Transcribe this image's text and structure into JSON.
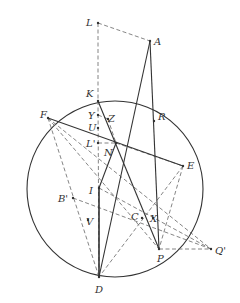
{
  "figure": {
    "type": "geometry-diagram",
    "circle": {
      "cx": 115,
      "cy": 189,
      "r": 88
    },
    "points": [
      {
        "id": "L",
        "label": "L",
        "x": 98,
        "y": 23,
        "lx": 86,
        "ly": 26
      },
      {
        "id": "A",
        "label": "A",
        "x": 150,
        "y": 41,
        "lx": 154,
        "ly": 45
      },
      {
        "id": "K",
        "label": "K",
        "x": 98,
        "y": 101,
        "lx": 86,
        "ly": 97
      },
      {
        "id": "R",
        "label": "R",
        "x": 154,
        "y": 121,
        "lx": 158,
        "ly": 120
      },
      {
        "id": "F",
        "label": "F",
        "x": 48,
        "y": 118,
        "lx": 40,
        "ly": 118
      },
      {
        "id": "Y",
        "label": "Y",
        "x": 98,
        "y": 115,
        "lx": 88,
        "ly": 119
      },
      {
        "id": "Z",
        "label": "Z",
        "x": 108,
        "y": 119,
        "lx": 108,
        "ly": 122
      },
      {
        "id": "U",
        "label": "U",
        "x": 98,
        "y": 128,
        "lx": 88,
        "ly": 131
      },
      {
        "id": "L'",
        "label": "L'",
        "x": 98,
        "y": 143,
        "lx": 86,
        "ly": 147
      },
      {
        "id": "N",
        "label": "N",
        "x": 116,
        "y": 143,
        "lx": 104,
        "ly": 156
      },
      {
        "id": "E",
        "label": "E",
        "x": 183,
        "y": 166,
        "lx": 187,
        "ly": 169
      },
      {
        "id": "I",
        "label": "I",
        "x": 99,
        "y": 188,
        "lx": 89,
        "ly": 194
      },
      {
        "id": "B'",
        "label": "B'",
        "x": 73,
        "y": 198,
        "lx": 58,
        "ly": 202
      },
      {
        "id": "V",
        "label": "V",
        "x": 88,
        "y": 220,
        "lx": 86,
        "ly": 225
      },
      {
        "id": "C",
        "label": "C",
        "x": 142,
        "y": 218,
        "lx": 131,
        "ly": 220
      },
      {
        "id": "X",
        "label": "X",
        "x": 153,
        "y": 218,
        "lx": 150,
        "ly": 222
      },
      {
        "id": "D",
        "label": "D",
        "x": 99,
        "y": 277,
        "lx": 95,
        "ly": 293
      },
      {
        "id": "P",
        "label": "P",
        "x": 159,
        "y": 249,
        "lx": 157,
        "ly": 262
      },
      {
        "id": "Q'",
        "label": "Q'",
        "x": 211,
        "y": 249,
        "lx": 215,
        "ly": 254
      }
    ],
    "solid_segments": [
      [
        "A",
        "D"
      ],
      [
        "A",
        "P"
      ],
      [
        "K",
        "P"
      ],
      [
        "F",
        "E"
      ],
      [
        "I",
        "D"
      ],
      [
        "N",
        "I"
      ],
      [
        "D",
        "I"
      ]
    ],
    "dashed_segments": [
      [
        "L",
        "A"
      ],
      [
        "L",
        "K"
      ],
      [
        "K",
        "D"
      ],
      [
        "F",
        "D"
      ],
      [
        "F",
        "P"
      ],
      [
        "F",
        "Q'"
      ],
      [
        "B'",
        "Q'"
      ],
      [
        "I",
        "Q'"
      ],
      [
        "E",
        "D"
      ],
      [
        "E",
        "P"
      ],
      [
        "P",
        "Q'"
      ],
      [
        "N",
        "E"
      ],
      [
        "L'",
        "N"
      ],
      [
        "Y",
        "Z"
      ],
      [
        "Z",
        "N"
      ]
    ]
  }
}
